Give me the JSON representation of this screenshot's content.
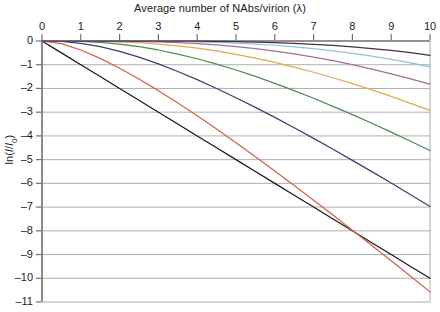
{
  "chart_data": {
    "type": "line",
    "title": "Average number of NAbs/virion (λ)",
    "xlabel": "Average number of NAbs/virion (λ)",
    "ylabel": "ln(I/I0)",
    "xlim": [
      0,
      10
    ],
    "ylim": [
      -11,
      0
    ],
    "xticks": [
      0,
      1,
      2,
      3,
      4,
      5,
      6,
      7,
      8,
      9,
      10
    ],
    "yticks": [
      0,
      -1,
      -2,
      -3,
      -4,
      -5,
      -6,
      -7,
      -8,
      -9,
      -10,
      -11
    ],
    "xtick_labels": [
      "0",
      "1",
      "2",
      "3",
      "4",
      "5",
      "6",
      "7",
      "8",
      "9",
      "10"
    ],
    "ytick_labels": [
      "0",
      "–1",
      "–2",
      "–3",
      "–4",
      "–5",
      "–6",
      "–7",
      "–8",
      "–9",
      "–10",
      "–11"
    ],
    "grid": "horizontal",
    "legend": "none",
    "x_axis_position": "top",
    "x": [
      0,
      0.5,
      1,
      1.5,
      2,
      2.5,
      3,
      3.5,
      4,
      4.5,
      5,
      5.5,
      6,
      6.5,
      7,
      7.5,
      8,
      8.5,
      9,
      9.5,
      10
    ],
    "series": [
      {
        "name": "threshold-1",
        "color": "#1a1a1a",
        "values": [
          0,
          -0.5,
          -1,
          -1.5,
          -2,
          -2.5,
          -3,
          -3.5,
          -4,
          -4.5,
          -5,
          -5.5,
          -6,
          -6.5,
          -7,
          -7.5,
          -8,
          -8.5,
          -9,
          -9.5,
          -10
        ]
      },
      {
        "name": "threshold-2",
        "color": "#d4604a",
        "values": [
          0,
          -0.111,
          -0.379,
          -0.733,
          -1.146,
          -1.603,
          -2.093,
          -2.611,
          -3.151,
          -3.71,
          -4.285,
          -4.874,
          -5.475,
          -6.086,
          -6.707,
          -7.336,
          -7.972,
          -8.614,
          -9.262,
          -9.916,
          -10.573
        ]
      },
      {
        "name": "threshold-3",
        "color": "#3b3f75",
        "values": [
          0,
          -0.018,
          -0.096,
          -0.238,
          -0.435,
          -0.681,
          -0.966,
          -1.284,
          -1.63,
          -2.0,
          -2.39,
          -2.798,
          -3.221,
          -3.657,
          -4.105,
          -4.563,
          -5.03,
          -5.505,
          -5.988,
          -6.477,
          -6.972
        ]
      },
      {
        "name": "threshold-4",
        "color": "#4f8a52",
        "values": [
          0,
          -0.002,
          -0.019,
          -0.061,
          -0.135,
          -0.24,
          -0.379,
          -0.549,
          -0.748,
          -0.973,
          -1.222,
          -1.493,
          -1.783,
          -2.091,
          -2.414,
          -2.752,
          -3.103,
          -3.466,
          -3.84,
          -4.224,
          -4.617
        ]
      },
      {
        "name": "threshold-5",
        "color": "#e0a951",
        "values": [
          0,
          0,
          -0.003,
          -0.013,
          -0.035,
          -0.072,
          -0.128,
          -0.204,
          -0.301,
          -0.42,
          -0.56,
          -0.72,
          -0.9,
          -1.099,
          -1.316,
          -1.549,
          -1.798,
          -2.061,
          -2.337,
          -2.626,
          -2.925
        ]
      },
      {
        "name": "threshold-6",
        "color": "#a3708a",
        "values": [
          0,
          0,
          0,
          -0.002,
          -0.008,
          -0.019,
          -0.038,
          -0.067,
          -0.109,
          -0.164,
          -0.234,
          -0.32,
          -0.422,
          -0.541,
          -0.677,
          -0.829,
          -0.998,
          -1.182,
          -1.381,
          -1.594,
          -1.82
        ]
      },
      {
        "name": "threshold-7",
        "color": "#8fc0dc",
        "values": [
          0,
          0,
          0,
          0,
          -0.002,
          -0.004,
          -0.01,
          -0.019,
          -0.034,
          -0.056,
          -0.086,
          -0.127,
          -0.179,
          -0.243,
          -0.321,
          -0.413,
          -0.519,
          -0.64,
          -0.775,
          -0.925,
          -1.09
        ]
      },
      {
        "name": "threshold-8",
        "color": "#4a2c46",
        "values": [
          0,
          0,
          0,
          0,
          0,
          -0.001,
          -0.002,
          -0.005,
          -0.009,
          -0.017,
          -0.029,
          -0.046,
          -0.069,
          -0.1,
          -0.139,
          -0.188,
          -0.247,
          -0.318,
          -0.4,
          -0.495,
          -0.603
        ]
      }
    ]
  },
  "axes": {
    "plot_left_px": 42,
    "plot_right_px": 430,
    "plot_top_px": 41,
    "plot_bottom_px": 302
  }
}
